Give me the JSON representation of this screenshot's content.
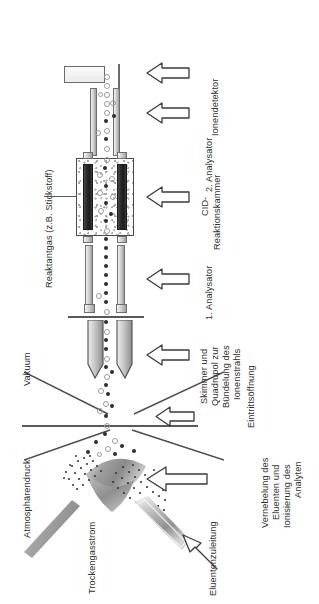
{
  "figure": {
    "orientation": "rotated-90",
    "language": "de"
  },
  "labels": {
    "reaktantgas": "Reaktantgas (z.B. Stickstoff)",
    "ionendetektor": "Ionendetektor",
    "analysator2": "2. Analysator",
    "cid_line1": "CID-",
    "cid_line2": "Reaktionskammer",
    "analysator1": "1. Analysator",
    "vakuum": "Vakuum",
    "skimmer_line1": "Skimmer und",
    "skimmer_line2": "Quadrupol zur",
    "skimmer_line3": "Bündelung des",
    "skimmer_line4": "Ionenstrahls",
    "eintrittsoeffnung": "Eintrittsöffnung",
    "atmosphaerendruck": "Atmosphärendruck",
    "vernebelung_line1": "Vernebelung des",
    "vernebelung_line2": "Eluenten und",
    "vernebelung_line3": "Ionisierung des",
    "vernebelung_line4": "Analyten",
    "trockengasstrom": "Trockengasstrom",
    "eluentenzuleitung": "Eluentenzuleitung"
  },
  "icons": {
    "arrow_detector": "left-arrow-icon",
    "arrow_analyser2": "left-arrow-icon",
    "arrow_cid": "left-arrow-icon",
    "arrow_analyser1": "left-arrow-icon",
    "arrow_skimmer": "left-arrow-icon",
    "arrow_entrance": "left-arrow-icon",
    "arrow_nebuliser": "left-arrow-icon",
    "arrow_eluent": "diagonal-arrow-icon"
  },
  "colors": {
    "ink": "#2b2b2b",
    "outline": "#4a4a4a",
    "rod_light": "#dcdcdc",
    "rod_dark": "#1d1d1d",
    "metal": "#8f8f8f",
    "background": "#ffffff"
  },
  "components": [
    {
      "name": "ion-detector",
      "label": "Ionendetektor"
    },
    {
      "name": "second-analyser",
      "label": "2. Analysator"
    },
    {
      "name": "cid-reaction-chamber",
      "label": "CID-Reaktionskammer"
    },
    {
      "name": "first-analyser",
      "label": "1. Analysator"
    },
    {
      "name": "skimmer-quadrupole",
      "label": "Skimmer und Quadrupol zur Bündelung des Ionenstrahls"
    },
    {
      "name": "entrance-orifice",
      "label": "Eintrittsöffnung"
    },
    {
      "name": "nebuliser-ion-source",
      "label": "Vernebelung des Eluenten und Ionisierung des Analyten"
    },
    {
      "name": "drying-gas-stream",
      "label": "Trockengasstrom"
    },
    {
      "name": "eluent-inlet",
      "label": "Eluentenzuleitung"
    }
  ],
  "regions": [
    {
      "name": "vacuum-region",
      "label": "Vakuum"
    },
    {
      "name": "atmospheric-pressure-region",
      "label": "Atmosphärendruck"
    }
  ]
}
